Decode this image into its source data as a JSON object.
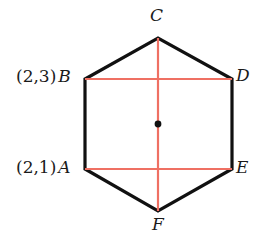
{
  "figure": {
    "shape": "hexagon",
    "colors": {
      "outline": "#111111",
      "chord": "#ef7063",
      "center_dot": "#111111",
      "background": "#ffffff",
      "text": "#1a1a1a"
    },
    "vertices": [
      {
        "name": "A",
        "x": 85,
        "y": 169,
        "coord_label": "(2,1)"
      },
      {
        "name": "B",
        "x": 85,
        "y": 79,
        "coord_label": "(2,3)"
      },
      {
        "name": "C",
        "x": 158,
        "y": 38,
        "coord_label": ""
      },
      {
        "name": "D",
        "x": 232,
        "y": 79,
        "coord_label": ""
      },
      {
        "name": "E",
        "x": 232,
        "y": 169,
        "coord_label": ""
      },
      {
        "name": "F",
        "x": 158,
        "y": 211,
        "coord_label": ""
      }
    ],
    "center": {
      "x": 158,
      "y": 124
    },
    "chords": [
      {
        "name": "chord-BD",
        "x1": 85,
        "y1": 79,
        "x2": 232,
        "y2": 79
      },
      {
        "name": "chord-AE",
        "x1": 85,
        "y1": 169,
        "x2": 232,
        "y2": 169
      },
      {
        "name": "chord-CF",
        "x1": 158,
        "y1": 38,
        "x2": 158,
        "y2": 211
      }
    ],
    "labels": {
      "C": "C",
      "D": "D",
      "E": "E",
      "F": "F",
      "A": "A",
      "B": "B",
      "A_coord": "(2,1)",
      "B_coord": "(2,3)",
      "paren_open": "(",
      "paren_close": ")",
      "A_coord_x": "2",
      "A_coord_y": "1",
      "B_coord_x": "2",
      "B_coord_y": "3",
      "comma": ","
    }
  }
}
